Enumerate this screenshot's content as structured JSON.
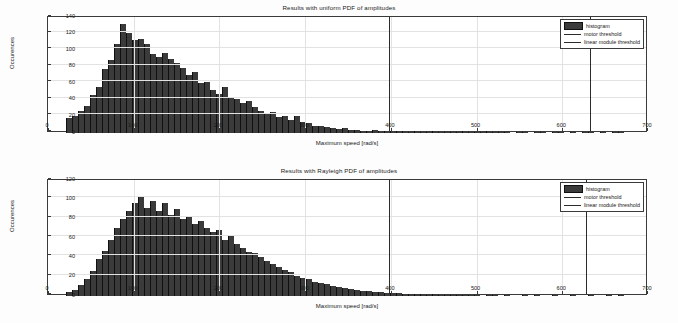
{
  "chart_data": [
    {
      "type": "bar",
      "title": "Results with uniform PDF of amplitudes",
      "xlabel": "Maximum speed [rad/s]",
      "ylabel": "Occurences",
      "xlim": [
        0,
        700
      ],
      "ylim": [
        0,
        140
      ],
      "xticks": [
        0,
        100,
        200,
        300,
        400,
        500,
        600,
        700
      ],
      "yticks": [
        0,
        20,
        40,
        60,
        80,
        100,
        120,
        140
      ],
      "grid": true,
      "legend": {
        "position": "top-right",
        "entries": [
          {
            "label": "histogram",
            "type": "swatch",
            "color": "#3b3b3b"
          },
          {
            "label": "motor threshold",
            "type": "line",
            "color": "#2b2b2b"
          },
          {
            "label": "linear module threshold",
            "type": "line",
            "color": "#2b2b2b"
          }
        ]
      },
      "annotations": [
        {
          "name": "motor-threshold",
          "x": 398,
          "type": "vline"
        },
        {
          "name": "linear-module-threshold",
          "x": 632,
          "type": "vline"
        }
      ],
      "bin_width": 7,
      "bin_centers": [
        24,
        31,
        38,
        45,
        52,
        59,
        66,
        73,
        80,
        87,
        94,
        101,
        108,
        115,
        122,
        129,
        136,
        143,
        150,
        157,
        164,
        171,
        178,
        185,
        192,
        199,
        206,
        213,
        220,
        227,
        234,
        241,
        248,
        255,
        262,
        269,
        276,
        283,
        290,
        297,
        304,
        311,
        318,
        325,
        332,
        339,
        346,
        353,
        360,
        367,
        374,
        381,
        388,
        395,
        402,
        409,
        416,
        423,
        430,
        437,
        444,
        451,
        458,
        465,
        472,
        479,
        486,
        493,
        500,
        507,
        514,
        521,
        528,
        535,
        542,
        549,
        556,
        563,
        570,
        577,
        584,
        591,
        598,
        605,
        612,
        619,
        626,
        633,
        640,
        647,
        654,
        661,
        668
      ],
      "values": [
        18,
        21,
        27,
        33,
        46,
        56,
        77,
        88,
        108,
        131,
        121,
        112,
        114,
        108,
        95,
        92,
        97,
        89,
        85,
        79,
        70,
        74,
        60,
        62,
        52,
        47,
        55,
        43,
        41,
        36,
        39,
        31,
        27,
        24,
        25,
        19,
        21,
        16,
        20,
        13,
        12,
        9,
        9,
        7,
        6,
        5,
        6,
        4,
        4,
        3,
        3,
        4,
        2,
        3,
        2,
        2,
        2,
        1,
        2,
        1,
        1,
        2,
        1,
        1,
        1,
        1,
        2,
        1,
        1,
        1,
        2,
        1,
        1,
        1,
        0,
        1,
        1,
        0,
        1,
        1,
        0,
        1,
        1,
        0,
        1,
        0,
        1,
        1,
        0,
        1,
        0,
        1,
        1
      ]
    },
    {
      "type": "bar",
      "title": "Results with Rayleigh PDF of amplitudes",
      "xlabel": "Maximum speed [rad/s]",
      "ylabel": "Occurences",
      "xlim": [
        0,
        700
      ],
      "ylim": [
        0,
        120
      ],
      "xticks": [
        0,
        100,
        200,
        300,
        400,
        500,
        600,
        700
      ],
      "yticks": [
        0,
        20,
        40,
        60,
        80,
        100,
        120
      ],
      "grid": true,
      "legend": {
        "position": "top-right",
        "entries": [
          {
            "label": "histogram",
            "type": "swatch",
            "color": "#3b3b3b"
          },
          {
            "label": "motor threshold",
            "type": "line",
            "color": "#2b2b2b"
          },
          {
            "label": "linear module threshold",
            "type": "line",
            "color": "#2b2b2b"
          }
        ]
      },
      "annotations": [
        {
          "name": "motor-threshold",
          "x": 398,
          "type": "vline"
        },
        {
          "name": "linear-module-threshold",
          "x": 628,
          "type": "vline"
        }
      ],
      "bin_width": 7,
      "bin_centers": [
        24,
        31,
        38,
        45,
        52,
        59,
        66,
        73,
        80,
        87,
        94,
        101,
        108,
        115,
        122,
        129,
        136,
        143,
        150,
        157,
        164,
        171,
        178,
        185,
        192,
        199,
        206,
        213,
        220,
        227,
        234,
        241,
        248,
        255,
        262,
        269,
        276,
        283,
        290,
        297,
        304,
        311,
        318,
        325,
        332,
        339,
        346,
        353,
        360,
        367,
        374,
        381,
        388,
        395,
        402,
        409,
        416,
        423,
        430,
        437,
        444,
        451,
        458,
        465,
        472,
        479,
        486,
        493,
        500,
        507,
        514,
        521,
        528,
        535,
        542,
        549,
        556,
        563,
        570,
        577,
        584,
        591,
        598,
        605,
        612,
        619,
        626,
        633,
        640,
        647,
        654,
        661,
        668
      ],
      "values": [
        4,
        6,
        11,
        18,
        26,
        38,
        47,
        58,
        70,
        80,
        88,
        96,
        102,
        91,
        98,
        88,
        96,
        84,
        90,
        80,
        83,
        74,
        78,
        70,
        66,
        68,
        58,
        62,
        54,
        50,
        46,
        44,
        40,
        36,
        33,
        30,
        27,
        25,
        21,
        19,
        18,
        15,
        13,
        12,
        10,
        9,
        8,
        7,
        6,
        5,
        5,
        4,
        4,
        3,
        3,
        3,
        2,
        2,
        2,
        2,
        1,
        2,
        1,
        1,
        1,
        1,
        1,
        1,
        1,
        0,
        1,
        1,
        0,
        1,
        0,
        0,
        1,
        0,
        1,
        0,
        0,
        1,
        0,
        0,
        1,
        0,
        0,
        1,
        0,
        0,
        1,
        0,
        1
      ]
    }
  ]
}
